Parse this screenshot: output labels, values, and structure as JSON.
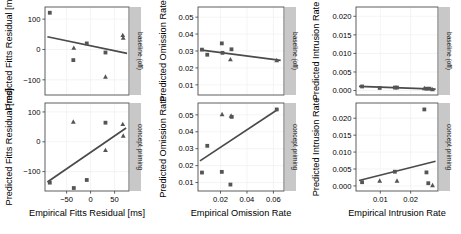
{
  "figure": {
    "title": "",
    "n_panel_columns": 3,
    "n_panel_rows": 2,
    "background": "#ffffff",
    "strip_background": "#c8c8c8",
    "panel_border_color": "#4d4d4d",
    "grid_color": "#efefef",
    "point_color": "#555555",
    "line_color": "#4a4a4a"
  },
  "strips": {
    "row1": "baseline (off)",
    "row2": "concept priming"
  },
  "chart_data": [
    {
      "type": "scatter",
      "id": "fitts-baseline",
      "title": "",
      "xlabel": "Empirical Fitts Residual [ms]",
      "ylabel": "Predicted Fitts Residual [ms]",
      "row_label": "baseline (off)",
      "xlim": [
        -95,
        80
      ],
      "ylim": [
        -150,
        140
      ],
      "xticks": [
        -50,
        0,
        50
      ],
      "xticklabels": [
        "−50",
        "0",
        "50"
      ],
      "yticks": [
        -100,
        0,
        100
      ],
      "yticklabels": [
        "−100",
        "0",
        "100"
      ],
      "grid": true,
      "legend": "none",
      "series": [
        {
          "name": "square-marker",
          "marker": "square",
          "points": [
            {
              "x": -85,
              "y": 121
            },
            {
              "x": -36,
              "y": -35
            },
            {
              "x": -8,
              "y": 20
            },
            {
              "x": 31,
              "y": -10
            }
          ]
        },
        {
          "name": "triangle-marker",
          "marker": "triangle",
          "points": [
            {
              "x": -35,
              "y": 5
            },
            {
              "x": 31,
              "y": -90
            },
            {
              "x": 67,
              "y": 47
            },
            {
              "x": 68,
              "y": 38
            }
          ]
        }
      ],
      "fit_line": {
        "x1": -90,
        "y1": 42,
        "x2": 76,
        "y2": -13
      }
    },
    {
      "type": "scatter",
      "id": "fitts-priming",
      "title": "",
      "xlabel": "Empirical Fitts Residual [ms]",
      "ylabel": "Predicted Fitts Residual [ms]",
      "row_label": "concept priming",
      "xlim": [
        -95,
        80
      ],
      "ylim": [
        -165,
        130
      ],
      "xticks": [
        -50,
        0,
        50
      ],
      "xticklabels": [
        "−50",
        "0",
        "50"
      ],
      "yticks": [
        -100,
        0,
        100
      ],
      "yticklabels": [
        "−100",
        "0",
        "100"
      ],
      "grid": true,
      "legend": "none",
      "series": [
        {
          "name": "square-marker",
          "marker": "square",
          "points": [
            {
              "x": -85,
              "y": -137
            },
            {
              "x": -35,
              "y": -155
            },
            {
              "x": -8,
              "y": -128
            },
            {
              "x": 31,
              "y": 64
            }
          ]
        },
        {
          "name": "triangle-marker",
          "marker": "triangle",
          "points": [
            {
              "x": -36,
              "y": 67
            },
            {
              "x": 31,
              "y": -28
            },
            {
              "x": 67,
              "y": 59
            },
            {
              "x": 68,
              "y": 20
            }
          ]
        }
      ],
      "fit_line": {
        "x1": -90,
        "y1": -135,
        "x2": 74,
        "y2": 46
      }
    },
    {
      "type": "scatter",
      "id": "omission-baseline",
      "title": "",
      "xlabel": "Empirical Omission Rate",
      "ylabel": "Predicted Omission Rate",
      "row_label": "baseline (off)",
      "xlim": [
        0.003,
        0.068
      ],
      "ylim": [
        0.004,
        0.056
      ],
      "xticks": [
        0.02,
        0.04,
        0.06
      ],
      "xticklabels": [
        "0.02",
        "0.04",
        "0.06"
      ],
      "yticks": [
        0.01,
        0.02,
        0.03,
        0.04,
        0.05
      ],
      "yticklabels": [
        "0.01",
        "0.02",
        "0.03",
        "0.04",
        "0.05"
      ],
      "grid": true,
      "legend": "none",
      "series": [
        {
          "name": "square-marker",
          "marker": "square",
          "points": [
            {
              "x": 0.006,
              "y": 0.0308
            },
            {
              "x": 0.01,
              "y": 0.0278
            },
            {
              "x": 0.021,
              "y": 0.0345
            },
            {
              "x": 0.0215,
              "y": 0.0289
            },
            {
              "x": 0.0283,
              "y": 0.031
            }
          ]
        },
        {
          "name": "triangle-marker",
          "marker": "triangle",
          "points": [
            {
              "x": 0.0275,
              "y": 0.025
            },
            {
              "x": 0.0625,
              "y": 0.0245
            }
          ]
        }
      ],
      "fit_line": {
        "x1": 0.0045,
        "y1": 0.0307,
        "x2": 0.0655,
        "y2": 0.0245
      }
    },
    {
      "type": "scatter",
      "id": "omission-priming",
      "title": "",
      "xlabel": "Empirical Omission Rate",
      "ylabel": "Predicted Omission Rate",
      "row_label": "concept priming",
      "xlim": [
        0.003,
        0.068
      ],
      "ylim": [
        0.005,
        0.057
      ],
      "xticks": [
        0.02,
        0.04,
        0.06
      ],
      "xticklabels": [
        "0.02",
        "0.04",
        "0.06"
      ],
      "yticks": [
        0.01,
        0.02,
        0.03,
        0.04,
        0.05
      ],
      "yticklabels": [
        "0.01",
        "0.02",
        "0.03",
        "0.04",
        "0.05"
      ],
      "grid": true,
      "legend": "none",
      "series": [
        {
          "name": "square-marker",
          "marker": "square",
          "points": [
            {
              "x": 0.006,
              "y": 0.0159
            },
            {
              "x": 0.01,
              "y": 0.0317
            },
            {
              "x": 0.021,
              "y": 0.0163
            },
            {
              "x": 0.0275,
              "y": 0.0088
            },
            {
              "x": 0.0285,
              "y": 0.0488
            },
            {
              "x": 0.0625,
              "y": 0.0532
            }
          ]
        },
        {
          "name": "triangle-marker",
          "marker": "triangle",
          "points": [
            {
              "x": 0.0212,
              "y": 0.0503
            },
            {
              "x": 0.028,
              "y": 0.0494
            }
          ]
        }
      ],
      "fit_line": {
        "x1": 0.0045,
        "y1": 0.0228,
        "x2": 0.0635,
        "y2": 0.0533
      }
    },
    {
      "type": "scatter",
      "id": "intrusion-baseline",
      "title": "",
      "xlabel": "Empirical Intrusion Rate",
      "ylabel": "Predicted Intrusion Rate",
      "row_label": "baseline (off)",
      "xlim": [
        0.002,
        0.029
      ],
      "ylim": [
        -0.0012,
        0.0225
      ],
      "xticks": [
        0.01,
        0.02
      ],
      "xticklabels": [
        "0.01",
        "0.02"
      ],
      "yticks": [
        0.0,
        0.005,
        0.01,
        0.015,
        0.02
      ],
      "yticklabels": [
        "0.000",
        "0.005",
        "0.010",
        "0.015",
        "0.020"
      ],
      "grid": true,
      "legend": "none",
      "series": [
        {
          "name": "square-marker",
          "marker": "square",
          "points": [
            {
              "x": 0.004,
              "y": 0.0011
            },
            {
              "x": 0.0098,
              "y": 0.0007
            },
            {
              "x": 0.0148,
              "y": 0.0008
            },
            {
              "x": 0.0155,
              "y": 0.0008
            },
            {
              "x": 0.0252,
              "y": 0.0005
            },
            {
              "x": 0.0262,
              "y": 0.0005
            }
          ]
        },
        {
          "name": "triangle-marker",
          "marker": "triangle",
          "points": [
            {
              "x": 0.0245,
              "y": 0.0006
            },
            {
              "x": 0.0272,
              "y": 0.0003
            }
          ]
        }
      ],
      "fit_line": {
        "x1": 0.003,
        "y1": 0.0011,
        "x2": 0.0282,
        "y2": 0.0004
      }
    },
    {
      "type": "scatter",
      "id": "intrusion-priming",
      "title": "",
      "xlabel": "Empirical Intrusion Rate",
      "ylabel": "Predicted Intrusion Rate",
      "row_label": "concept priming",
      "xlim": [
        0.002,
        0.029
      ],
      "ylim": [
        -0.0015,
        0.0245
      ],
      "xticks": [
        0.01,
        0.02
      ],
      "xticklabels": [
        "0.01",
        "0.02"
      ],
      "yticks": [
        0.0,
        0.005,
        0.01,
        0.015,
        0.02
      ],
      "yticklabels": [
        "0.000",
        "0.005",
        "0.010",
        "0.015",
        "0.020"
      ],
      "grid": true,
      "legend": "none",
      "series": [
        {
          "name": "square-marker",
          "marker": "square",
          "points": [
            {
              "x": 0.004,
              "y": 0.0011
            },
            {
              "x": 0.0148,
              "y": 0.0042
            },
            {
              "x": 0.0245,
              "y": 0.0226
            },
            {
              "x": 0.0252,
              "y": 0.004
            },
            {
              "x": 0.0258,
              "y": 0.0008
            }
          ]
        },
        {
          "name": "triangle-marker",
          "marker": "triangle",
          "points": [
            {
              "x": 0.0098,
              "y": 0.0015
            },
            {
              "x": 0.0155,
              "y": 0.0015
            },
            {
              "x": 0.0272,
              "y": 0.0002
            }
          ]
        }
      ],
      "fit_line": {
        "x1": 0.003,
        "y1": 0.0016,
        "x2": 0.0282,
        "y2": 0.0073
      }
    }
  ]
}
